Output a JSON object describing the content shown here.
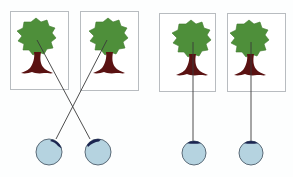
{
  "diagram": {
    "background": "#fdfefe",
    "colors": {
      "frame_stroke": "#b8bcc0",
      "frame_fill": "#ffffff",
      "foliage": "#4e8f3a",
      "foliage_dark": "#3f7a2e",
      "trunk": "#5a1212",
      "line": "#3a3a3a",
      "eye_fill": "#b5d3e0",
      "eye_stroke": "#5b6b78",
      "pupil": "#1b2550"
    },
    "panels": [
      {
        "id": "left-pair",
        "description": "crossed lines from trees to eyes",
        "crossed": true
      },
      {
        "id": "right-pair",
        "description": "straight lines from trees to eyes",
        "crossed": false
      }
    ],
    "frames": [
      {
        "x": 10,
        "y": 11,
        "w": 58,
        "h": 78
      },
      {
        "x": 80,
        "y": 11,
        "w": 58,
        "h": 79
      },
      {
        "x": 159,
        "y": 13,
        "w": 56,
        "h": 78
      },
      {
        "x": 227,
        "y": 13,
        "w": 58,
        "h": 78
      }
    ],
    "eyes": [
      {
        "cx": 49,
        "cy": 152,
        "r": 13
      },
      {
        "cx": 98,
        "cy": 152,
        "r": 13
      },
      {
        "cx": 194,
        "cy": 153,
        "r": 12
      },
      {
        "cx": 251,
        "cy": 153,
        "r": 12
      }
    ],
    "lines": [
      {
        "x1": 37,
        "y1": 40,
        "x2": 90,
        "y2": 138
      },
      {
        "x1": 107,
        "y1": 40,
        "x2": 56,
        "y2": 138
      },
      {
        "x1": 193,
        "y1": 42,
        "x2": 193,
        "y2": 141
      },
      {
        "x1": 251,
        "y1": 42,
        "x2": 251,
        "y2": 141
      }
    ]
  }
}
